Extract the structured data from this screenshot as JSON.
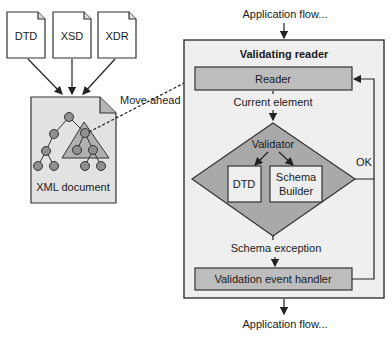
{
  "diagram": {
    "schemas": [
      {
        "label": "DTD"
      },
      {
        "label": "XSD"
      },
      {
        "label": "XDR"
      }
    ],
    "xml_document": {
      "label": "XML document"
    },
    "move_ahead_label": "Move ahead",
    "app_flow_top": "Application flow...",
    "app_flow_bottom": "Application flow...",
    "validating_reader": {
      "title": "Validating reader",
      "reader": "Reader",
      "current_element": "Current element",
      "validator": {
        "label": "Validator",
        "dtd": "DTD",
        "schema_builder_line1": "Schema",
        "schema_builder_line2": "Builder"
      },
      "ok_label": "OK",
      "schema_exception": "Schema exception",
      "event_handler": "Validation event handler"
    },
    "colors": {
      "panel_fill": "#efefef",
      "box_fill": "#bdbdbd",
      "diamond_fill": "#a9a9a9",
      "doc_fill": "#e2e2e2",
      "node_fill": "#8f8f8f"
    }
  }
}
